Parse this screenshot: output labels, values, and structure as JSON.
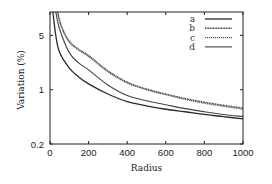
{
  "chart_data": {
    "type": "line",
    "title": "",
    "xlabel": "Radius",
    "ylabel": "Variation (%)",
    "xlim": [
      0,
      1000
    ],
    "ylim": [
      0.2,
      10
    ],
    "yscale": "log",
    "grid": false,
    "legend_position": "top-right",
    "xticks": [
      0,
      200,
      400,
      600,
      800,
      1000
    ],
    "xtick_labels": [
      "0",
      "200",
      "400",
      "600",
      "800",
      "1000"
    ],
    "yticks": [
      0.2,
      1,
      5
    ],
    "ytick_labels": [
      "0.2",
      "1",
      "5"
    ],
    "x": [
      15,
      30,
      40,
      60,
      100,
      150,
      200,
      300,
      400,
      500,
      600,
      700,
      800,
      900,
      1000
    ],
    "series": [
      {
        "name": "a",
        "style": "solid",
        "x": [
          15,
          30,
          50,
          100,
          150,
          200,
          300,
          400,
          500,
          600,
          700,
          800,
          900,
          1000
        ],
        "values": [
          10,
          5.0,
          3.0,
          1.9,
          1.45,
          1.19,
          0.88,
          0.7,
          0.62,
          0.56,
          0.52,
          0.48,
          0.45,
          0.42
        ]
      },
      {
        "name": "b",
        "style": "dotted",
        "x": [
          40,
          60,
          100,
          150,
          200,
          300,
          400,
          500,
          600,
          700,
          800,
          900,
          1000
        ],
        "values": [
          10,
          6.5,
          4.2,
          3.3,
          2.75,
          1.75,
          1.25,
          1.02,
          0.88,
          0.77,
          0.69,
          0.63,
          0.58
        ]
      },
      {
        "name": "c",
        "style": "dashed",
        "x": [
          38,
          60,
          100,
          150,
          200,
          300,
          400,
          500,
          600,
          700,
          800,
          900,
          1000
        ],
        "values": [
          10,
          6.3,
          4.1,
          3.2,
          2.68,
          1.7,
          1.22,
          1.0,
          0.86,
          0.75,
          0.67,
          0.61,
          0.56
        ]
      },
      {
        "name": "d",
        "style": "solid-thin",
        "x": [
          30,
          50,
          100,
          150,
          200,
          300,
          400,
          500,
          600,
          700,
          800,
          900,
          1000
        ],
        "values": [
          10,
          6.0,
          3.0,
          2.2,
          1.8,
          1.15,
          0.84,
          0.72,
          0.64,
          0.57,
          0.52,
          0.48,
          0.45
        ]
      }
    ]
  }
}
